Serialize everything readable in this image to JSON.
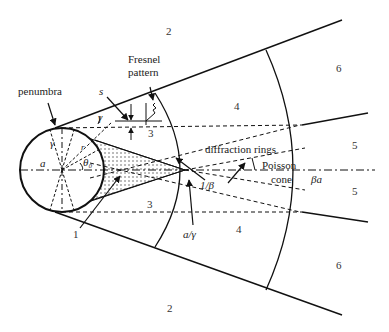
{
  "diagram": {
    "labels": {
      "penumbra": "penumbra",
      "fresnel_line1": "Fresnel",
      "fresnel_line2": "pattern",
      "s": "s",
      "gamma_top": "γ",
      "gamma_circle": "γ",
      "a": "a",
      "r": "r",
      "theta0": "θ₀",
      "diffraction_rings": "diffraction rings",
      "poisson_line1": "Poisson",
      "poisson_line2": "cone",
      "beta_a": "βa",
      "inv_beta": "1/β",
      "a_over_gamma": "a/γ"
    },
    "regions": {
      "r1": "1",
      "r2_top": "2",
      "r2_bottom": "2",
      "r3_top": "3",
      "r3_bottom": "3",
      "r4_top": "4",
      "r4_bottom": "4",
      "r5_top": "5",
      "r5_bottom": "5",
      "r6_top": "6",
      "r6_bottom": "6"
    },
    "colors": {
      "line": "#111111",
      "stipple": "#555555"
    }
  }
}
